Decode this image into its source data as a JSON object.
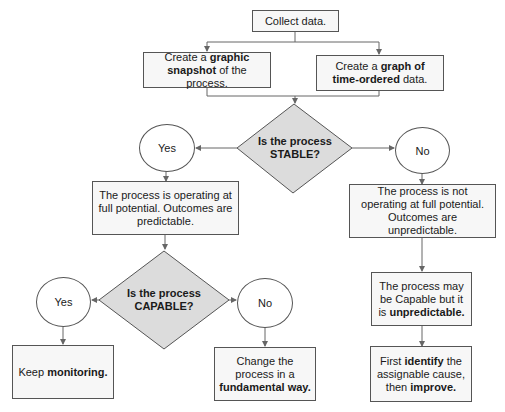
{
  "nodes": {
    "collect": {
      "text": "Collect data."
    },
    "snapshot": {
      "pre": "Create a ",
      "bold1": "graphic",
      "mid": " ",
      "bold2": "snapshot",
      "post": " of the process."
    },
    "timegraph": {
      "pre": "Create a ",
      "bold1": "graph of time-ordered",
      "post": " data."
    },
    "stable_q": {
      "line1": "Is the process",
      "line2": "STABLE?"
    },
    "stable_yes": {
      "text": "Yes"
    },
    "stable_no": {
      "text": "No"
    },
    "full_potential": {
      "text": "The process is operating at full potential. Outcomes are predictable."
    },
    "not_full_potential": {
      "text": "The process is not operating at full potential. Outcomes are unpredictable."
    },
    "capable_q": {
      "line1": "Is the process",
      "line2": "CAPABLE?"
    },
    "capable_yes": {
      "text": "Yes"
    },
    "capable_no": {
      "text": "No"
    },
    "keep_monitoring": {
      "pre": "Keep ",
      "bold": "monitoring."
    },
    "change_process": {
      "pre": "Change the process in a ",
      "bold": "fundamental way."
    },
    "may_be_capable": {
      "pre": "The process may be Capable but it is ",
      "bold": "unpredictable."
    },
    "identify": {
      "pre": "First ",
      "bold1": "identify",
      "mid": " the assignable cause, then ",
      "bold2": "improve."
    }
  },
  "colors": {
    "diamond_fill": "#dcdcdc",
    "line": "#666666",
    "box_fill": "#f7f7f7"
  }
}
